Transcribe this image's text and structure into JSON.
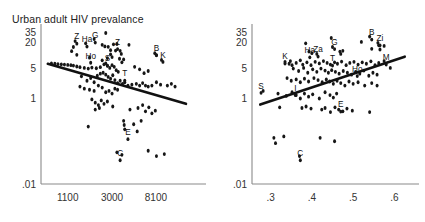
{
  "figure": {
    "title": "Urban adult HIV prevalance",
    "background_color": "#ffffff",
    "point_color": "#161616",
    "line_color": "#111111",
    "axis_color": "#8a8a8a"
  },
  "chart_data": [
    {
      "type": "scatter",
      "panel": "left",
      "title": "Urban adult HIV prevalance",
      "xlabel": "",
      "ylabel": "",
      "yscale": "log",
      "xscale": "log",
      "grid": false,
      "legend": "none",
      "ytick_labels": [
        "35",
        "20",
        "5",
        "1",
        ".01"
      ],
      "ytick_values": [
        35,
        20,
        5,
        1,
        0.01
      ],
      "xtick_labels": [
        "1100",
        "3000",
        "8100"
      ],
      "xtick_values": [
        1100,
        3000,
        8100
      ],
      "xlim": [
        600,
        22000
      ],
      "ylim": [
        0.01,
        40
      ],
      "trend": {
        "direction": "negative",
        "x0": 700,
        "y0": 6.5,
        "x1": 16000,
        "y1": 0.75
      },
      "annotations": [
        {
          "label": "Z",
          "x": 1350,
          "y": 24.0
        },
        {
          "label": "G",
          "x": 2050,
          "y": 25.5
        },
        {
          "label": "Ha",
          "x": 1700,
          "y": 20.5
        },
        {
          "label": "Z",
          "x": 3400,
          "y": 18.0
        },
        {
          "label": "B",
          "x": 8200,
          "y": 13.0
        },
        {
          "label": "K",
          "x": 9500,
          "y": 9.0
        },
        {
          "label": "Ho",
          "x": 1850,
          "y": 8.6
        },
        {
          "label": "S",
          "x": 2700,
          "y": 7.4
        },
        {
          "label": "T",
          "x": 4000,
          "y": 3.3
        },
        {
          "label": "E",
          "x": 4300,
          "y": 0.14
        },
        {
          "label": "C",
          "x": 3600,
          "y": 0.045
        }
      ],
      "points": [
        [
          2600,
          34.0
        ],
        [
          1300,
          22.0
        ],
        [
          2000,
          24.5
        ],
        [
          1650,
          19.5
        ],
        [
          1250,
          16.0
        ],
        [
          1200,
          12.8
        ],
        [
          2400,
          18.0
        ],
        [
          2550,
          16.5
        ],
        [
          2750,
          16.2
        ],
        [
          3100,
          18.5
        ],
        [
          3350,
          18.8
        ],
        [
          4400,
          18.0
        ],
        [
          2900,
          13.5
        ],
        [
          3250,
          13.2
        ],
        [
          3600,
          13.0
        ],
        [
          1350,
          10.5
        ],
        [
          1800,
          9.0
        ],
        [
          2900,
          10.8
        ],
        [
          3700,
          11.0
        ],
        [
          7900,
          11.5
        ],
        [
          8200,
          10.2
        ],
        [
          9200,
          8.0
        ],
        [
          3550,
          8.5
        ],
        [
          3750,
          7.0
        ],
        [
          3900,
          8.2
        ],
        [
          760,
          6.6
        ],
        [
          820,
          6.5
        ],
        [
          880,
          6.4
        ],
        [
          950,
          6.3
        ],
        [
          1020,
          6.2
        ],
        [
          1100,
          6.1
        ],
        [
          1180,
          6.0
        ],
        [
          1250,
          5.9
        ],
        [
          1350,
          5.6
        ],
        [
          1450,
          5.4
        ],
        [
          1600,
          5.2
        ],
        [
          1750,
          5.0
        ],
        [
          1900,
          5.3
        ],
        [
          2100,
          5.1
        ],
        [
          2300,
          5.4
        ],
        [
          2500,
          6.3
        ],
        [
          2600,
          6.6
        ],
        [
          2700,
          5.8
        ],
        [
          2850,
          5.2
        ],
        [
          3000,
          6.0
        ],
        [
          3150,
          5.5
        ],
        [
          3300,
          4.6
        ],
        [
          3450,
          4.2
        ],
        [
          1500,
          3.3
        ],
        [
          1700,
          2.6
        ],
        [
          1850,
          3.0
        ],
        [
          2000,
          2.4
        ],
        [
          2150,
          3.4
        ],
        [
          2300,
          3.8
        ],
        [
          2450,
          4.0
        ],
        [
          2600,
          3.6
        ],
        [
          2750,
          3.2
        ],
        [
          2900,
          2.9
        ],
        [
          3050,
          3.5
        ],
        [
          3200,
          2.7
        ],
        [
          3400,
          2.3
        ],
        [
          3600,
          2.6
        ],
        [
          3800,
          2.2
        ],
        [
          4000,
          2.4
        ],
        [
          4300,
          2.0
        ],
        [
          4700,
          2.1
        ],
        [
          5200,
          2.2
        ],
        [
          5600,
          2.0
        ],
        [
          6000,
          2.3
        ],
        [
          6400,
          2.0
        ],
        [
          6800,
          1.9
        ],
        [
          7400,
          2.0
        ],
        [
          8200,
          2.4
        ],
        [
          9000,
          2.1
        ],
        [
          10500,
          2.0
        ],
        [
          1450,
          1.9
        ],
        [
          1600,
          1.7
        ],
        [
          1800,
          1.6
        ],
        [
          2000,
          1.5
        ],
        [
          2200,
          2.0
        ],
        [
          2400,
          1.8
        ],
        [
          2600,
          1.4
        ],
        [
          2800,
          1.5
        ],
        [
          3000,
          1.3
        ],
        [
          3200,
          1.7
        ],
        [
          3400,
          1.6
        ],
        [
          1900,
          0.95
        ],
        [
          2050,
          0.8
        ],
        [
          2200,
          0.7
        ],
        [
          2350,
          0.9
        ],
        [
          2500,
          0.75
        ],
        [
          2700,
          0.85
        ],
        [
          2050,
          0.55
        ],
        [
          2250,
          0.6
        ],
        [
          3050,
          0.65
        ],
        [
          4500,
          0.55
        ],
        [
          5400,
          0.6
        ],
        [
          6000,
          0.7
        ],
        [
          6400,
          0.5
        ],
        [
          6900,
          0.62
        ],
        [
          7400,
          0.45
        ],
        [
          8000,
          0.52
        ],
        [
          1750,
          0.22
        ],
        [
          3900,
          0.3
        ],
        [
          3950,
          0.24
        ],
        [
          4000,
          0.19
        ],
        [
          4900,
          0.25
        ],
        [
          5300,
          0.17
        ],
        [
          5800,
          0.3
        ],
        [
          3350,
          0.055
        ],
        [
          3750,
          0.048
        ],
        [
          6800,
          0.06
        ],
        [
          8200,
          0.045
        ],
        [
          9800,
          0.05
        ],
        [
          11500,
          2.2
        ],
        [
          12500,
          1.9
        ],
        [
          5000,
          5.5
        ],
        [
          5600,
          4.8
        ],
        [
          6200,
          3.9
        ],
        [
          6800,
          4.4
        ],
        [
          2400,
          7.8
        ],
        [
          2700,
          8.8
        ],
        [
          3000,
          9.3
        ]
      ]
    },
    {
      "type": "scatter",
      "panel": "right",
      "title": "",
      "xlabel": "",
      "ylabel": "",
      "yscale": "log",
      "xscale": "linear",
      "grid": false,
      "legend": "none",
      "ytick_labels": [
        "35",
        "20",
        "5",
        "1",
        ".01"
      ],
      "ytick_values": [
        35,
        20,
        5,
        1,
        0.01
      ],
      "xtick_labels": [
        ".3",
        ".4",
        ".5",
        ".6"
      ],
      "xtick_values": [
        0.3,
        0.4,
        0.5,
        0.6
      ],
      "xlim": [
        0.255,
        0.645
      ],
      "ylim": [
        0.01,
        40
      ],
      "trend": {
        "direction": "positive",
        "x0": 0.275,
        "y0": 0.72,
        "x1": 0.625,
        "y1": 9.5
      },
      "annotations": [
        {
          "label": "B",
          "x": 0.545,
          "y": 30.0
        },
        {
          "label": "Zi",
          "x": 0.565,
          "y": 22.0
        },
        {
          "label": "G",
          "x": 0.455,
          "y": 18.0
        },
        {
          "label": "Ha",
          "x": 0.395,
          "y": 11.5
        },
        {
          "label": "Za",
          "x": 0.415,
          "y": 12.0
        },
        {
          "label": "K",
          "x": 0.335,
          "y": 8.2
        },
        {
          "label": "T",
          "x": 0.45,
          "y": 7.4
        },
        {
          "label": "M",
          "x": 0.58,
          "y": 7.8
        },
        {
          "label": "Ho",
          "x": 0.51,
          "y": 4.2
        },
        {
          "label": "S",
          "x": 0.277,
          "y": 1.7
        },
        {
          "label": "I",
          "x": 0.36,
          "y": 1.5
        },
        {
          "label": "E",
          "x": 0.47,
          "y": 0.62
        },
        {
          "label": "C",
          "x": 0.372,
          "y": 0.045
        }
      ],
      "points": [
        [
          0.447,
          26.0
        ],
        [
          0.54,
          28.0
        ],
        [
          0.52,
          21.0
        ],
        [
          0.56,
          20.0
        ],
        [
          0.562,
          17.5
        ],
        [
          0.575,
          17.0
        ],
        [
          0.545,
          14.5
        ],
        [
          0.565,
          14.0
        ],
        [
          0.385,
          19.5
        ],
        [
          0.45,
          16.0
        ],
        [
          0.393,
          12.5
        ],
        [
          0.4,
          11.5
        ],
        [
          0.412,
          11.0
        ],
        [
          0.468,
          12.5
        ],
        [
          0.475,
          13.0
        ],
        [
          0.47,
          11.0
        ],
        [
          0.335,
          7.2
        ],
        [
          0.345,
          6.5
        ],
        [
          0.352,
          6.0
        ],
        [
          0.348,
          7.5
        ],
        [
          0.362,
          6.8
        ],
        [
          0.372,
          7.8
        ],
        [
          0.378,
          6.2
        ],
        [
          0.388,
          7.0
        ],
        [
          0.398,
          6.0
        ],
        [
          0.408,
          7.2
        ],
        [
          0.418,
          6.6
        ],
        [
          0.428,
          7.5
        ],
        [
          0.437,
          6.8
        ],
        [
          0.445,
          6.2
        ],
        [
          0.455,
          7.0
        ],
        [
          0.462,
          6.5
        ],
        [
          0.472,
          7.3
        ],
        [
          0.483,
          6.0
        ],
        [
          0.492,
          6.8
        ],
        [
          0.502,
          7.2
        ],
        [
          0.512,
          6.2
        ],
        [
          0.522,
          7.0
        ],
        [
          0.532,
          6.5
        ],
        [
          0.543,
          7.4
        ],
        [
          0.553,
          6.0
        ],
        [
          0.562,
          6.8
        ],
        [
          0.575,
          7.5
        ],
        [
          0.59,
          5.2
        ],
        [
          0.355,
          5.0
        ],
        [
          0.368,
          4.4
        ],
        [
          0.38,
          5.2
        ],
        [
          0.39,
          4.0
        ],
        [
          0.402,
          4.8
        ],
        [
          0.412,
          4.2
        ],
        [
          0.422,
          5.0
        ],
        [
          0.432,
          4.5
        ],
        [
          0.44,
          4.0
        ],
        [
          0.448,
          4.6
        ],
        [
          0.457,
          4.2
        ],
        [
          0.466,
          3.8
        ],
        [
          0.476,
          4.4
        ],
        [
          0.486,
          4.0
        ],
        [
          0.496,
          3.6
        ],
        [
          0.506,
          4.2
        ],
        [
          0.516,
          3.8
        ],
        [
          0.526,
          4.5
        ],
        [
          0.538,
          3.4
        ],
        [
          0.548,
          4.0
        ],
        [
          0.558,
          3.6
        ],
        [
          0.34,
          3.0
        ],
        [
          0.35,
          2.6
        ],
        [
          0.362,
          2.8
        ],
        [
          0.372,
          2.4
        ],
        [
          0.382,
          2.9
        ],
        [
          0.392,
          2.5
        ],
        [
          0.405,
          3.0
        ],
        [
          0.415,
          2.7
        ],
        [
          0.425,
          2.4
        ],
        [
          0.435,
          2.8
        ],
        [
          0.443,
          2.5
        ],
        [
          0.452,
          2.2
        ],
        [
          0.461,
          2.6
        ],
        [
          0.47,
          2.3
        ],
        [
          0.48,
          2.0
        ],
        [
          0.49,
          2.5
        ],
        [
          0.5,
          2.2
        ],
        [
          0.512,
          2.4
        ],
        [
          0.528,
          2.0
        ],
        [
          0.545,
          2.3
        ],
        [
          0.558,
          2.0
        ],
        [
          0.282,
          1.5
        ],
        [
          0.318,
          1.3
        ],
        [
          0.338,
          1.15
        ],
        [
          0.352,
          1.4
        ],
        [
          0.362,
          1.2
        ],
        [
          0.372,
          1.0
        ],
        [
          0.382,
          1.3
        ],
        [
          0.392,
          1.1
        ],
        [
          0.402,
          1.25
        ],
        [
          0.418,
          1.0
        ],
        [
          0.432,
          1.4
        ],
        [
          0.444,
          1.2
        ],
        [
          0.452,
          1.05
        ],
        [
          0.46,
          1.3
        ],
        [
          0.322,
          0.62
        ],
        [
          0.376,
          0.6
        ],
        [
          0.386,
          0.65
        ],
        [
          0.398,
          0.58
        ],
        [
          0.424,
          0.55
        ],
        [
          0.432,
          0.6
        ],
        [
          0.445,
          0.48
        ],
        [
          0.456,
          0.62
        ],
        [
          0.465,
          0.55
        ],
        [
          0.475,
          0.5
        ],
        [
          0.485,
          0.58
        ],
        [
          0.498,
          0.52
        ],
        [
          0.54,
          0.48
        ],
        [
          0.308,
          0.12
        ],
        [
          0.312,
          0.09
        ],
        [
          0.332,
          0.13
        ],
        [
          0.37,
          0.045
        ],
        [
          0.42,
          0.12
        ],
        [
          0.455,
          0.1
        ]
      ]
    }
  ]
}
